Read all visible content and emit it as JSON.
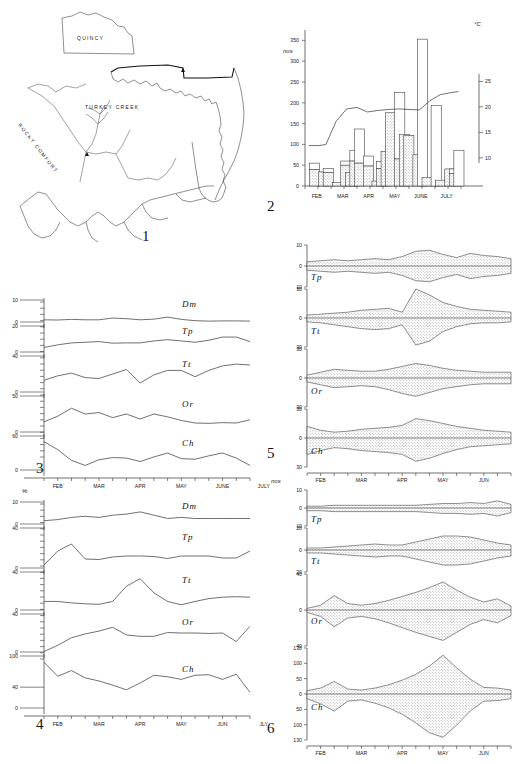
{
  "figure": {
    "panels": [
      "1",
      "2",
      "3",
      "4",
      "5",
      "6"
    ],
    "map": {
      "inset_label": "QUINCY",
      "labels": [
        "TURKEY CREEK",
        "ROCKY COMFORT"
      ],
      "number": "1"
    }
  },
  "chart_data": [
    {
      "panel": "2",
      "type": "bar",
      "title": "",
      "ylabel": "nos",
      "y2label": "°C",
      "categories": [
        "FEB",
        "MAR",
        "APR",
        "MAY",
        "JUNE",
        "JULY"
      ],
      "yticks": [
        0,
        50,
        100,
        150,
        200,
        250,
        300,
        350
      ],
      "ylim": [
        0,
        375
      ],
      "y2ticks": [
        10,
        15,
        20,
        25
      ],
      "y2lim": [
        8,
        27
      ],
      "xlabel": "",
      "grid": false,
      "legend": "",
      "bars": [
        {
          "x": 0.35,
          "stippled": 40,
          "white": 55
        },
        {
          "x": 1.05,
          "stippled": 34,
          "white": 34
        },
        {
          "x": 1.4,
          "stippled": 33,
          "white": 42
        },
        {
          "x": 2.1,
          "stippled": 8,
          "white": 8
        },
        {
          "x": 2.75,
          "stippled": 50,
          "white": 60
        },
        {
          "x": 3.1,
          "stippled": 33,
          "white": 33
        },
        {
          "x": 3.45,
          "stippled": 60,
          "white": 86
        },
        {
          "x": 3.8,
          "stippled": 55,
          "white": 137
        },
        {
          "x": 4.5,
          "stippled": 48,
          "white": 72
        },
        {
          "x": 5.15,
          "stippled": 12,
          "white": 12
        },
        {
          "x": 5.5,
          "stippled": 42,
          "white": 59
        },
        {
          "x": 5.85,
          "stippled": 83,
          "white": 83
        },
        {
          "x": 6.2,
          "stippled": 176,
          "white": 176
        },
        {
          "x": 6.9,
          "stippled": 65,
          "white": 225
        },
        {
          "x": 7.25,
          "stippled": 124,
          "white": 124
        },
        {
          "x": 7.6,
          "stippled": 121,
          "white": 121
        },
        {
          "x": 8.3,
          "stippled": 75,
          "white": 75
        },
        {
          "x": 8.65,
          "stippled": 0,
          "white": 353
        },
        {
          "x": 9.0,
          "stippled": 21,
          "white": 21
        },
        {
          "x": 9.7,
          "stippled": 0,
          "white": 194
        },
        {
          "x": 10.05,
          "stippled": 14,
          "white": 14
        },
        {
          "x": 10.75,
          "stippled": 41,
          "white": 41
        },
        {
          "x": 11.1,
          "stippled": 30,
          "white": 41
        },
        {
          "x": 11.45,
          "stippled": 0,
          "white": 86
        }
      ],
      "temperature_series": {
        "name": "water temperature",
        "x": [
          0.3,
          1.0,
          1.6,
          2.4,
          3.2,
          4.0,
          4.8,
          5.6,
          6.4,
          7.2,
          8.0,
          8.8,
          9.6,
          10.4,
          11.2,
          11.8
        ],
        "values": [
          12.4,
          12.4,
          12.6,
          17.2,
          19.6,
          19.9,
          19.0,
          19.3,
          19.5,
          19.6,
          19.5,
          19.4,
          21.2,
          22.4,
          22.8,
          23.0
        ]
      }
    },
    {
      "panel": "3",
      "type": "line",
      "ylabel": "",
      "xlabel": "",
      "categories": [
        "FEB",
        "MAR",
        "APR",
        "MAY",
        "JUNE",
        "JULY"
      ],
      "grid": false,
      "series": [
        {
          "name": "Dm",
          "ymax": 10,
          "yticks": [
            0,
            10
          ],
          "values": [
            1.0,
            0.9,
            1.2,
            1.0,
            1.0,
            1.8,
            1.5,
            1.0,
            1.3,
            2.2,
            1.2,
            0.6,
            0.4,
            0.5,
            0.5,
            0.4
          ]
        },
        {
          "name": "Tp",
          "ymax": 20,
          "yticks": [
            0,
            20
          ],
          "values": [
            3.5,
            5.5,
            7.0,
            7.5,
            8.0,
            6.8,
            7.0,
            7.0,
            8.5,
            9.5,
            8.5,
            7.5,
            9.0,
            11.5,
            11.5,
            8.0
          ]
        },
        {
          "name": "Tt",
          "ymax": 40,
          "yticks": [
            0,
            40
          ],
          "values": [
            13.0,
            18.0,
            21.0,
            16.0,
            15.0,
            20.0,
            25.0,
            10.0,
            19.0,
            24.0,
            24.0,
            17.0,
            24.0,
            29.0,
            31.0,
            30.0
          ]
        },
        {
          "name": "Or",
          "ymax": 50,
          "yticks": [
            0,
            50
          ],
          "values": [
            14.0,
            22.0,
            33.0,
            25.0,
            27.0,
            20.0,
            25.0,
            18.0,
            25.0,
            21.0,
            16.0,
            12.5,
            12.0,
            13.0,
            12.5,
            17.0
          ]
        },
        {
          "name": "Ch",
          "ymax": 60,
          "yticks": [
            0,
            60
          ],
          "values": [
            50.0,
            36.0,
            17.0,
            8.0,
            18.0,
            22.0,
            21.0,
            15.0,
            23.0,
            30.0,
            20.0,
            19.0,
            25.0,
            30.0,
            21.0,
            8.0
          ]
        }
      ]
    },
    {
      "panel": "4",
      "type": "line",
      "ylabel": "%",
      "xlabel": "",
      "categories": [
        "FEB",
        "MAR",
        "APR",
        "MAY",
        "JUN",
        "JLY"
      ],
      "grid": false,
      "series": [
        {
          "name": "Dm",
          "ymax": 10,
          "yticks": [
            0,
            10
          ],
          "values": [
            1.5,
            2.0,
            3.0,
            3.5,
            3.0,
            4.0,
            4.5,
            5.5,
            4.0,
            2.5,
            3.0,
            2.5,
            2.5,
            2.5,
            2.5,
            2.5
          ]
        },
        {
          "name": "Tp",
          "ymax": 40,
          "yticks": [
            0,
            40
          ],
          "values": [
            3.0,
            17.0,
            24.0,
            9.0,
            8.5,
            11.0,
            12.0,
            12.0,
            11.5,
            9.5,
            12.0,
            12.0,
            12.0,
            10.0,
            10.0,
            17.0
          ]
        },
        {
          "name": "Tt",
          "ymax": 40,
          "yticks": [
            0,
            40
          ],
          "values": [
            9.0,
            9.0,
            7.5,
            6.5,
            6.0,
            9.0,
            25.0,
            33.0,
            18.0,
            9.0,
            5.5,
            9.0,
            12.0,
            13.5,
            14.0,
            13.5
          ]
        },
        {
          "name": "Or",
          "ymax": 40,
          "yticks": [
            0,
            40
          ],
          "values": [
            0.5,
            7.0,
            15.0,
            19.0,
            22.0,
            26.0,
            18.0,
            16.5,
            16.5,
            20.5,
            20.0,
            20.0,
            19.5,
            20.0,
            11.0,
            27.0
          ]
        },
        {
          "name": "Ch",
          "ymax": 100,
          "yticks": [
            0,
            40,
            100
          ],
          "values": [
            88.0,
            61.0,
            72.0,
            58.0,
            52.0,
            44.0,
            35.0,
            48.0,
            63.0,
            60.0,
            55.0,
            63.0,
            64.0,
            55.0,
            65.0,
            30.0
          ]
        }
      ]
    },
    {
      "panel": "5",
      "type": "area",
      "subtype": "kite",
      "ylabel": "",
      "xlabel": "",
      "categories": [
        "FEB",
        "MAR",
        "APR",
        "MAY",
        "JUN",
        "JLY"
      ],
      "grid": false,
      "series": [
        {
          "name": "Tp",
          "yticks": [
            10,
            0,
            10
          ],
          "ymax": 10,
          "upper": [
            2,
            2.5,
            3,
            2.5,
            3,
            3.5,
            3,
            4.5,
            7,
            7.5,
            5.5,
            4,
            6,
            5,
            4.5,
            3.5
          ],
          "lower": [
            2,
            2.5,
            3,
            2.5,
            3,
            3.5,
            3,
            4.5,
            7,
            7.5,
            5.5,
            4,
            6,
            5,
            4.5,
            3.5
          ]
        },
        {
          "name": "Tt",
          "yticks": [
            30,
            0,
            30
          ],
          "ymax": 30,
          "upper": [
            3,
            4,
            5,
            6,
            8,
            9,
            10,
            6,
            30,
            24,
            16,
            12,
            9,
            8,
            7,
            6
          ],
          "lower": [
            4,
            5,
            7,
            9,
            11,
            12,
            11,
            7,
            28,
            24,
            14,
            9,
            6,
            5,
            5,
            4
          ]
        },
        {
          "name": "Or",
          "yticks": [
            30,
            0,
            30
          ],
          "ymax": 30,
          "upper": [
            3,
            6,
            9,
            8,
            7,
            7,
            9,
            12,
            15,
            13,
            10,
            8,
            7,
            6,
            6,
            6
          ],
          "lower": [
            4,
            7,
            10,
            9,
            8,
            9,
            12,
            16,
            19,
            15,
            11,
            9,
            7,
            6,
            6,
            6
          ]
        },
        {
          "name": "Ch",
          "yticks": [
            30,
            0,
            30
          ],
          "ymax": 30,
          "upper": [
            12,
            8,
            6,
            7,
            9,
            10,
            11,
            13,
            20,
            18,
            15,
            12,
            10,
            8,
            7,
            6
          ],
          "lower": [
            17,
            13,
            10,
            11,
            13,
            14,
            15,
            17,
            24,
            21,
            16,
            12,
            9,
            8,
            7,
            6
          ]
        }
      ]
    },
    {
      "panel": "6",
      "type": "area",
      "subtype": "kite",
      "ylabel": "nos",
      "xlabel": "",
      "categories": [
        "FEB",
        "MAR",
        "APR",
        "MAY",
        "JUN",
        "JLY"
      ],
      "grid": false,
      "series": [
        {
          "name": "Tp",
          "yticks": [
            10,
            0,
            10
          ],
          "ymax": 20,
          "upper": [
            2,
            2,
            3,
            3,
            3,
            3,
            3,
            3,
            3,
            4,
            5,
            5,
            6,
            5,
            8,
            4
          ],
          "lower": [
            3,
            3,
            4,
            4,
            4,
            4,
            4,
            4,
            4,
            5,
            6,
            6,
            7,
            6,
            9,
            5
          ]
        },
        {
          "name": "Tt",
          "yticks": [
            20,
            0,
            20
          ],
          "ymax": 22,
          "upper": [
            2,
            2,
            3,
            4,
            5,
            6,
            5,
            5,
            8,
            11,
            14,
            14,
            13,
            10,
            7,
            5
          ],
          "lower": [
            3,
            3,
            4,
            5,
            6,
            7,
            6,
            6,
            9,
            12,
            15,
            15,
            14,
            11,
            8,
            6
          ]
        },
        {
          "name": "Or",
          "yticks": [
            40,
            0,
            40
          ],
          "ymax": 45,
          "upper": [
            2,
            6,
            18,
            8,
            6,
            8,
            12,
            17,
            22,
            28,
            35,
            25,
            16,
            10,
            14,
            5
          ],
          "lower": [
            3,
            8,
            21,
            10,
            8,
            11,
            16,
            22,
            28,
            33,
            38,
            28,
            18,
            12,
            16,
            7
          ]
        },
        {
          "name": "Ch",
          "yticks": [
            130,
            100,
            50,
            0,
            50,
            100,
            130
          ],
          "ymax": 140,
          "upper": [
            10,
            18,
            38,
            15,
            12,
            18,
            28,
            42,
            60,
            85,
            118,
            80,
            45,
            20,
            18,
            12
          ],
          "lower": [
            14,
            30,
            52,
            22,
            18,
            28,
            42,
            62,
            88,
            118,
            132,
            95,
            52,
            22,
            20,
            14
          ]
        }
      ]
    }
  ]
}
